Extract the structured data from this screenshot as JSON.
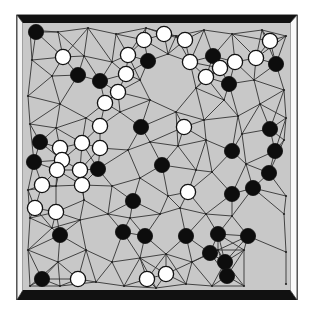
{
  "figure": {
    "type": "go-board-diagram",
    "caption_partial": "",
    "colors": {
      "board": "#c8c8c8",
      "frame_dark": "#111111",
      "frame_light": "#ffffff",
      "frame_outline": "#222222",
      "grid_line": "#333333",
      "black_stone": "#0d0d0d",
      "white_stone": "#ffffff",
      "stone_outline": "#111111"
    }
  },
  "stones": {
    "black": [
      [
        36,
        32
      ],
      [
        78,
        75
      ],
      [
        100,
        81
      ],
      [
        148,
        61
      ],
      [
        213,
        56
      ],
      [
        276,
        64
      ],
      [
        229,
        84
      ],
      [
        141,
        127
      ],
      [
        270,
        129
      ],
      [
        40,
        142
      ],
      [
        275,
        151
      ],
      [
        34,
        162
      ],
      [
        98,
        169
      ],
      [
        162,
        165
      ],
      [
        232,
        151
      ],
      [
        269,
        173
      ],
      [
        253,
        188
      ],
      [
        232,
        194
      ],
      [
        133,
        201
      ],
      [
        60,
        235
      ],
      [
        123,
        232
      ],
      [
        145,
        236
      ],
      [
        186,
        236
      ],
      [
        218,
        234
      ],
      [
        248,
        236
      ],
      [
        210,
        253
      ],
      [
        225,
        262
      ],
      [
        227,
        276
      ],
      [
        42,
        279
      ]
    ],
    "white": [
      [
        63,
        57
      ],
      [
        128,
        55
      ],
      [
        144,
        40
      ],
      [
        164,
        34
      ],
      [
        185,
        40
      ],
      [
        126,
        74
      ],
      [
        190,
        62
      ],
      [
        206,
        77
      ],
      [
        220,
        68
      ],
      [
        235,
        62
      ],
      [
        256,
        58
      ],
      [
        270,
        41
      ],
      [
        118,
        92
      ],
      [
        105,
        103
      ],
      [
        100,
        126
      ],
      [
        100,
        148
      ],
      [
        82,
        143
      ],
      [
        60,
        148
      ],
      [
        62,
        160
      ],
      [
        57,
        170
      ],
      [
        80,
        170
      ],
      [
        42,
        185
      ],
      [
        82,
        185
      ],
      [
        35,
        208
      ],
      [
        56,
        212
      ],
      [
        184,
        127
      ],
      [
        188,
        192
      ],
      [
        78,
        279
      ],
      [
        147,
        279
      ],
      [
        166,
        274
      ]
    ]
  },
  "grid_nodes": [
    [
      30,
      30
    ],
    [
      58,
      32
    ],
    [
      88,
      28
    ],
    [
      116,
      34
    ],
    [
      146,
      28
    ],
    [
      176,
      36
    ],
    [
      204,
      30
    ],
    [
      232,
      34
    ],
    [
      262,
      30
    ],
    [
      286,
      36
    ],
    [
      32,
      60
    ],
    [
      52,
      76
    ],
    [
      84,
      56
    ],
    [
      112,
      62
    ],
    [
      140,
      80
    ],
    [
      168,
      54
    ],
    [
      196,
      88
    ],
    [
      224,
      100
    ],
    [
      254,
      80
    ],
    [
      284,
      90
    ],
    [
      28,
      96
    ],
    [
      60,
      104
    ],
    [
      86,
      118
    ],
    [
      120,
      112
    ],
    [
      150,
      100
    ],
    [
      176,
      112
    ],
    [
      204,
      120
    ],
    [
      238,
      116
    ],
    [
      260,
      104
    ],
    [
      286,
      118
    ],
    [
      30,
      124
    ],
    [
      56,
      128
    ],
    [
      128,
      150
    ],
    [
      150,
      142
    ],
    [
      178,
      146
    ],
    [
      206,
      140
    ],
    [
      242,
      134
    ],
    [
      284,
      140
    ],
    [
      28,
      190
    ],
    [
      56,
      186
    ],
    [
      84,
      200
    ],
    [
      112,
      186
    ],
    [
      140,
      178
    ],
    [
      168,
      196
    ],
    [
      196,
      170
    ],
    [
      212,
      172
    ],
    [
      246,
      164
    ],
    [
      286,
      196
    ],
    [
      30,
      218
    ],
    [
      52,
      228
    ],
    [
      80,
      220
    ],
    [
      108,
      214
    ],
    [
      130,
      218
    ],
    [
      160,
      214
    ],
    [
      180,
      208
    ],
    [
      206,
      214
    ],
    [
      232,
      216
    ],
    [
      284,
      214
    ],
    [
      28,
      250
    ],
    [
      58,
      262
    ],
    [
      86,
      250
    ],
    [
      112,
      262
    ],
    [
      140,
      258
    ],
    [
      166,
      254
    ],
    [
      192,
      262
    ],
    [
      218,
      250
    ],
    [
      244,
      250
    ],
    [
      286,
      252
    ],
    [
      30,
      286
    ],
    [
      60,
      286
    ],
    [
      96,
      282
    ],
    [
      124,
      286
    ],
    [
      156,
      288
    ],
    [
      186,
      284
    ],
    [
      212,
      286
    ],
    [
      244,
      286
    ],
    [
      286,
      284
    ]
  ]
}
